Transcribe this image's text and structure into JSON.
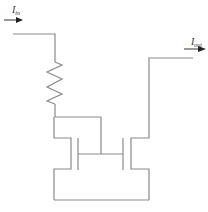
{
  "diagram": {
    "type": "current-mirror-circuit",
    "labels": {
      "input_current": {
        "main": "I",
        "sub": "in"
      },
      "output_current": {
        "main": "I",
        "sub": "out"
      }
    },
    "colors": {
      "wire": "#8a8a8a",
      "arrow": "#333333",
      "background": "#ffffff"
    },
    "components": [
      {
        "id": "R1",
        "kind": "resistor",
        "orientation": "vertical"
      },
      {
        "id": "M1",
        "kind": "transistor",
        "role": "diode-connected reference"
      },
      {
        "id": "M2",
        "kind": "transistor",
        "role": "output"
      }
    ]
  }
}
